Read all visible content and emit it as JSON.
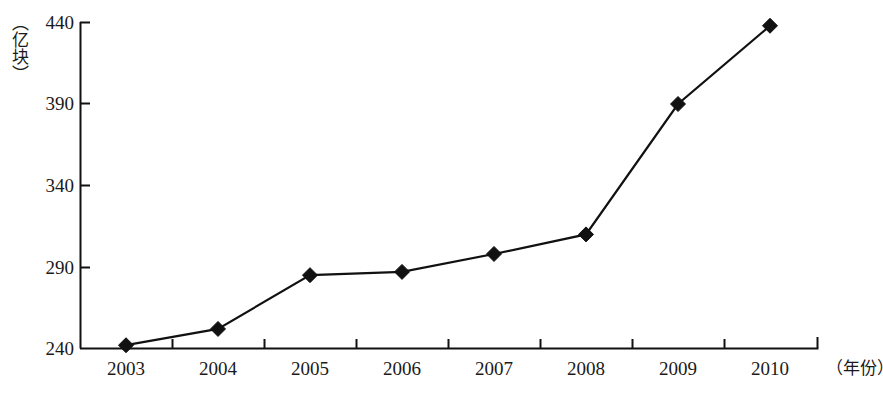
{
  "chart_data": {
    "type": "line",
    "title": "",
    "xlabel": "（年份）",
    "ylabel": "（亿块）",
    "categories": [
      "2003",
      "2004",
      "2005",
      "2006",
      "2007",
      "2008",
      "2009",
      "2010"
    ],
    "values": [
      242,
      252,
      285,
      287,
      298,
      310,
      390,
      438
    ],
    "series": [
      {
        "name": "产量",
        "values": [
          242,
          252,
          285,
          287,
          298,
          310,
          390,
          438
        ]
      }
    ],
    "ylim": [
      240,
      440
    ],
    "yticks": [
      240,
      290,
      340,
      390,
      440
    ],
    "ytick_labels": [
      "240",
      "290",
      "340",
      "390",
      "440"
    ],
    "grid": false,
    "legend": "none",
    "marker": "diamond",
    "line_color": "#111111",
    "marker_color": "#111111",
    "axis_color": "#111111",
    "background": "#ffffff"
  },
  "axes": {
    "y_unit_label": "（亿块）",
    "x_unit_label": "（年份）"
  }
}
